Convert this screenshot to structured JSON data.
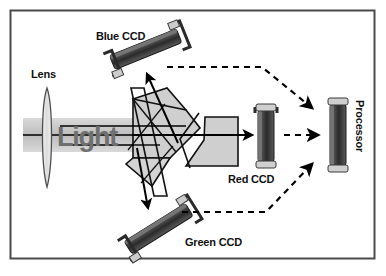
{
  "figure": {
    "frame_color": "#4a4a4a",
    "background_color": "#ffffff"
  },
  "labels": {
    "lens": "Lens",
    "light": "Light",
    "blue_ccd": "Blue CCD",
    "green_ccd": "Green CCD",
    "red_ccd": "Red CCD",
    "processor": "Processor"
  },
  "components": {
    "lens": {
      "name": "Lens",
      "shape": "biconvex-lens",
      "fill": "#e3e3e3",
      "stroke": "#555555"
    },
    "prism": {
      "name": "Beam splitter prism assembly",
      "fill": "#cfcfcf",
      "stroke": "#111111"
    },
    "blue_ccd": {
      "name": "Blue CCD",
      "orientation": "tilted-up-right",
      "body_color": "#3a3a3a",
      "cap_color": "#d0d0d0"
    },
    "green_ccd": {
      "name": "Green CCD",
      "orientation": "tilted-down-right",
      "body_color": "#3a3a3a",
      "cap_color": "#d0d0d0"
    },
    "red_ccd": {
      "name": "Red CCD",
      "orientation": "vertical",
      "body_color": "#3a3a3a",
      "cap_color": "#d0d0d0"
    },
    "processor": {
      "name": "Processor",
      "orientation": "vertical",
      "body_color": "#3a3a3a",
      "cap_color": "#d0d0d0"
    }
  },
  "beams": {
    "incoming": {
      "name": "incoming white light beam",
      "style": "solid",
      "band_color": "#c4c4c4",
      "ray_color": "#000000",
      "ray_count": 3
    },
    "to_blue": {
      "name": "split beam to blue sensor",
      "style": "solid-arrow"
    },
    "to_green": {
      "name": "split beam to green sensor",
      "style": "solid-arrow"
    },
    "to_red": {
      "name": "split beam to red sensor",
      "style": "solid-arrow"
    },
    "blue_signal": {
      "name": "blue signal to processor",
      "style": "dashed-arrow"
    },
    "green_signal": {
      "name": "green signal to processor",
      "style": "dashed-arrow"
    },
    "red_signal": {
      "name": "red signal to processor",
      "style": "dashed-arrow"
    }
  }
}
